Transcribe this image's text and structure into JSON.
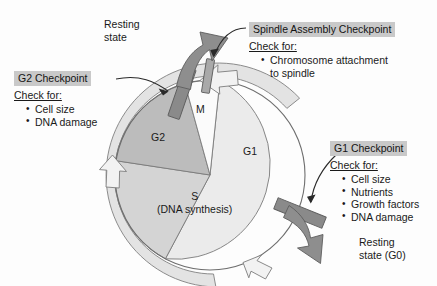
{
  "figure": {
    "kind": "cell-cycle-checkpoint-diagram"
  },
  "cycle": {
    "phases": [
      {
        "id": "m",
        "label": "M"
      },
      {
        "id": "g1",
        "label": "G1"
      },
      {
        "id": "s",
        "label": "S",
        "sublabel": "(DNA synthesis)"
      },
      {
        "id": "g2",
        "label": "G2"
      }
    ]
  },
  "phase_labels": {
    "m": "M",
    "g1": "G1",
    "g2": "G2",
    "s_main": "S",
    "s_sub": "(DNA synthesis)"
  },
  "callouts": [
    {
      "id": "g2-checkpoint",
      "title": "G2 Checkpoint",
      "check_label": "Check for:",
      "items": [
        "Cell size",
        "DNA damage"
      ]
    },
    {
      "id": "spindle-assembly-checkpoint",
      "title": "Spindle Assembly Checkpoint",
      "check_label": "Check for:",
      "items": [
        "Chromosome attachment",
        "to spindle"
      ]
    },
    {
      "id": "g1-checkpoint",
      "title": "G1 Checkpoint",
      "check_label": "Check for:",
      "items": [
        "Cell size",
        "Nutrients",
        "Growth factors",
        "DNA damage"
      ]
    }
  ],
  "g2_checkpoint": {
    "title": "G2 Checkpoint",
    "check_label": "Check for:",
    "item_1": "Cell size",
    "item_2": "DNA damage"
  },
  "spindle_checkpoint": {
    "title": "Spindle Assembly Checkpoint",
    "check_label": "Check for:",
    "item_1": "Chromosome attachment",
    "item_1_cont": "to spindle"
  },
  "g1_checkpoint": {
    "title": "G1 Checkpoint",
    "check_label": "Check for:",
    "item_1": "Cell size",
    "item_2": "Nutrients",
    "item_3": "Growth factors",
    "item_4": "DNA damage"
  },
  "exits": {
    "top_line_1": "Resting",
    "top_line_2": "state",
    "bottom_line_1": "Resting",
    "bottom_line_2": "state (G0)"
  },
  "colors": {
    "background": "#fdfdfd",
    "g1_fill": "#ebebeb",
    "s_fill": "#d4d4d4",
    "g2_fill": "#bcbcbc",
    "m_fill": "#fbfbfb",
    "ring_fill": "#e3e3e3",
    "arrow_white_fill": "#f2f2f2",
    "exit_arrow_fill": "#8e8e8e",
    "checkpoint_bar_fill": "#8a8a8a",
    "outline": "#6e6e6e",
    "title_highlight": "#c9c9c9",
    "text": "#1a1a1a"
  }
}
